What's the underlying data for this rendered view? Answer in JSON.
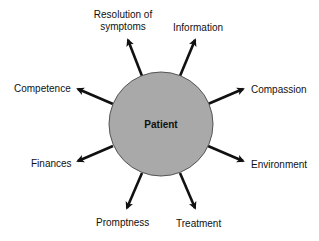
{
  "diagram": {
    "type": "radial",
    "center": {
      "label": "Patient",
      "fill": "#a9a9a9",
      "stroke": "#555555"
    },
    "arrow_color": "#111111",
    "nodes": [
      {
        "label_lines": [
          "Resolution of",
          "symptoms"
        ],
        "direction": "up-left"
      },
      {
        "label_lines": [
          "Information"
        ],
        "direction": "up-right"
      },
      {
        "label_lines": [
          "Compassion"
        ],
        "direction": "right-up"
      },
      {
        "label_lines": [
          "Environment"
        ],
        "direction": "right-down"
      },
      {
        "label_lines": [
          "Treatment"
        ],
        "direction": "down-right"
      },
      {
        "label_lines": [
          "Promptness"
        ],
        "direction": "down-left"
      },
      {
        "label_lines": [
          "Finances"
        ],
        "direction": "left-down"
      },
      {
        "label_lines": [
          "Competence"
        ],
        "direction": "left-up"
      }
    ]
  }
}
